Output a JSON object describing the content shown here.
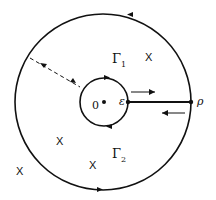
{
  "diagram": {
    "labels": {
      "origin": "0",
      "epsilon": "ε",
      "rho": "ρ",
      "gamma1": "Γ",
      "gamma1_sub": "1",
      "gamma2": "Γ",
      "gamma2_sub": "2",
      "pole_marker": "X"
    },
    "poles": [
      {
        "x": 148,
        "y": 57
      },
      {
        "x": 59,
        "y": 141
      },
      {
        "x": 92,
        "y": 165
      },
      {
        "x": 19,
        "y": 171
      }
    ],
    "colors": {
      "stroke": "#111111",
      "background": "#ffffff"
    }
  }
}
